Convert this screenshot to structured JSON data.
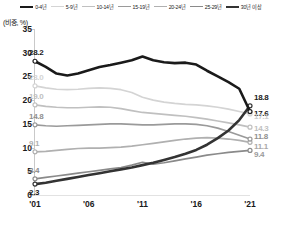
{
  "axis_unit": "(비중, %)",
  "legend": {
    "items": [
      {
        "label": "0-4년",
        "color": "#1a1a1a",
        "width": 2.2
      },
      {
        "label": "5-9년",
        "color": "#d4d4d4",
        "width": 1.6
      },
      {
        "label": "10-14년",
        "color": "#c0c0c0",
        "width": 1.6
      },
      {
        "label": "15-19년",
        "color": "#9a9a9a",
        "width": 1.6
      },
      {
        "label": "20-24년",
        "color": "#b0b0b0",
        "width": 1.6
      },
      {
        "label": "25-29년",
        "color": "#8a8a8a",
        "width": 1.6
      },
      {
        "label": "30년 이상",
        "color": "#333333",
        "width": 2.2
      }
    ]
  },
  "yticks": [
    "0",
    "5",
    "10",
    "15",
    "20",
    "25",
    "30",
    "35"
  ],
  "xticks": [
    "'01",
    "'06",
    "'11",
    "'16",
    "'21"
  ],
  "start_labels": {
    "s0_4": "28.2",
    "s5_9": "23.0",
    "s10_14": "19.0",
    "s15_19": "14.8",
    "s20_24": "9.1",
    "s25_29": "3.4",
    "s30p": "2.3"
  },
  "end_labels": {
    "e30p": "18.8",
    "e0_4": "17.6",
    "e5_9": "17.1",
    "e10_14": "14.3",
    "e15_19": "11.8",
    "e20_24": "11.1",
    "e25_29": "9.4"
  },
  "chart_data": {
    "type": "line",
    "title": "",
    "subtitle": "",
    "xlabel": "",
    "ylabel": "(비중, %)",
    "ylim": [
      0,
      35
    ],
    "grid": false,
    "legend_position": "top-center",
    "x": [
      2001,
      2002,
      2003,
      2004,
      2005,
      2006,
      2007,
      2008,
      2009,
      2010,
      2011,
      2012,
      2013,
      2014,
      2015,
      2016,
      2017,
      2018,
      2019,
      2020,
      2021
    ],
    "tick_years": [
      2001,
      2006,
      2011,
      2016,
      2021
    ],
    "series": [
      {
        "name": "0-4년",
        "color": "#1a1a1a",
        "start_value": 28.2,
        "end_value": 17.6,
        "values": [
          28.2,
          27.0,
          25.6,
          25.2,
          25.6,
          26.3,
          27.0,
          27.4,
          27.9,
          28.4,
          29.2,
          28.4,
          28.0,
          27.8,
          27.9,
          27.5,
          26.2,
          25.0,
          23.8,
          22.4,
          17.6
        ]
      },
      {
        "name": "5-9년",
        "color": "#d4d4d4",
        "start_value": 23.0,
        "end_value": 17.1,
        "values": [
          23.0,
          22.6,
          22.3,
          22.2,
          22.3,
          22.5,
          22.6,
          22.5,
          22.2,
          21.6,
          20.6,
          20.0,
          19.6,
          19.3,
          19.1,
          19.0,
          18.8,
          18.5,
          18.1,
          17.6,
          17.1
        ]
      },
      {
        "name": "10-14년",
        "color": "#c0c0c0",
        "start_value": 19.0,
        "end_value": 14.3,
        "values": [
          19.0,
          18.7,
          18.5,
          18.4,
          18.4,
          18.5,
          18.6,
          18.5,
          18.2,
          17.8,
          17.4,
          17.2,
          17.0,
          16.8,
          16.6,
          16.3,
          16.0,
          15.6,
          15.2,
          14.8,
          14.3
        ]
      },
      {
        "name": "15-19년",
        "color": "#9a9a9a",
        "start_value": 14.8,
        "end_value": 11.8,
        "values": [
          14.8,
          14.6,
          14.5,
          14.6,
          14.7,
          14.8,
          14.9,
          15.0,
          15.0,
          14.9,
          14.8,
          14.8,
          14.9,
          15.0,
          15.0,
          14.9,
          14.6,
          14.1,
          13.4,
          12.6,
          11.8
        ]
      },
      {
        "name": "20-24년",
        "color": "#b0b0b0",
        "start_value": 9.1,
        "end_value": 11.1,
        "values": [
          9.1,
          9.2,
          9.4,
          9.6,
          9.8,
          9.9,
          9.9,
          10.0,
          10.1,
          10.3,
          10.6,
          10.9,
          11.2,
          11.5,
          11.8,
          12.0,
          12.1,
          12.0,
          11.8,
          11.5,
          11.1
        ]
      },
      {
        "name": "25-29년",
        "color": "#8a8a8a",
        "start_value": 3.4,
        "end_value": 9.4,
        "values": [
          3.4,
          3.7,
          4.0,
          4.3,
          4.6,
          4.9,
          5.2,
          5.5,
          5.8,
          6.3,
          6.9,
          6.5,
          6.8,
          7.2,
          7.6,
          8.0,
          8.4,
          8.7,
          9.0,
          9.2,
          9.4
        ]
      },
      {
        "name": "30년 이상",
        "color": "#333333",
        "start_value": 2.3,
        "end_value": 18.8,
        "values": [
          2.3,
          2.6,
          3.0,
          3.4,
          3.8,
          4.2,
          4.6,
          5.0,
          5.4,
          5.8,
          6.3,
          6.8,
          7.4,
          8.0,
          8.7,
          9.5,
          10.6,
          12.0,
          13.6,
          15.8,
          18.8
        ]
      }
    ]
  }
}
